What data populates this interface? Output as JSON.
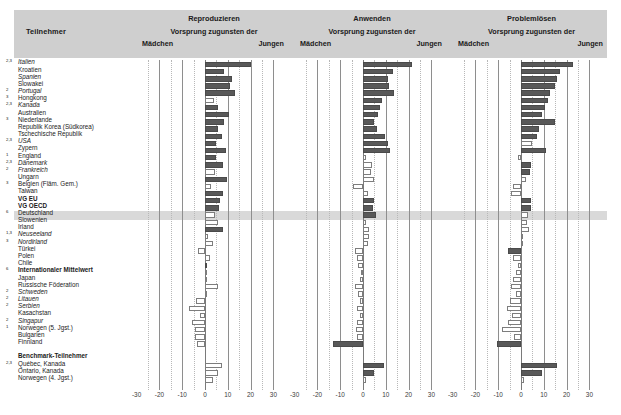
{
  "header": {
    "participants_label": "Teilnehmer",
    "panels": [
      {
        "title": "Reproduzieren",
        "subtitle": "Vorsprung zugunsten der",
        "girls": "Mädchen",
        "boys": "Jungen"
      },
      {
        "title": "Anwenden",
        "subtitle": "Vorsprung zugunsten der",
        "girls": "Mädchen",
        "boys": "Jungen"
      },
      {
        "title": "Problemlösen",
        "subtitle": "Vorsprung zugunsten der",
        "girls": "Mädchen",
        "boys": "Jungen"
      }
    ]
  },
  "axis": {
    "ticks": [
      "-30",
      "-20",
      "-10",
      "0",
      "10",
      "20",
      "30"
    ],
    "tick_values": [
      -30,
      -20,
      -10,
      0,
      10,
      20,
      30
    ],
    "min": -34,
    "max": 34
  },
  "chart_data": {
    "type": "bar",
    "xlabel": "Vorsprung zugunsten der Mädchen / Jungen",
    "ylabel": "Teilnehmer",
    "xlim": [
      -34,
      34
    ],
    "grid": true,
    "legend_position": "none",
    "orientation": "horizontal",
    "series_names": [
      "Reproduzieren",
      "Anwenden",
      "Problemlösen"
    ],
    "fill_meaning": {
      "filled": "statistisch signifikant",
      "open": "nicht signifikant"
    },
    "categories": [
      "Italien",
      "Kroatien",
      "Spanien",
      "Slowakei",
      "Portugal",
      "Hongkong",
      "Kanada",
      "Australien",
      "Niederlande",
      "Republik Korea (Südkorea)",
      "Tschechische Republik",
      "USA",
      "Zypern",
      "England",
      "Dänemark",
      "Frankreich",
      "Ungarn",
      "Belgien (Fläm. Gem.)",
      "Taiwan",
      "VG EU",
      "VG OECD",
      "Deutschland",
      "Slowenien",
      "Irland",
      "Neuseeland",
      "Nordirland",
      "Türkei",
      "Polen",
      "Chile",
      "Internationaler Mittelwert",
      "Japan",
      "Russische Föderation",
      "Schweden",
      "Litauen",
      "Serbien",
      "Kasachstan",
      "Singapur",
      "Norwegen (5. Jgst.)",
      "Bulgarien",
      "Finnland",
      "Québec, Kanada",
      "Ontario, Kanada",
      "Norwegen (4. Jgst.)"
    ],
    "rows": [
      {
        "label": "Italien",
        "sup": "2,3",
        "style": "italic",
        "reproduzieren": 20.0,
        "rep_sig": true,
        "anwenden": 21.5,
        "anw_sig": true,
        "problemloesen": 23.0,
        "prob_sig": true
      },
      {
        "label": "Kroatien",
        "sup": "",
        "style": "normal",
        "reproduzieren": 8.5,
        "rep_sig": true,
        "anwenden": 13.0,
        "anw_sig": true,
        "problemloesen": 17.0,
        "prob_sig": true
      },
      {
        "label": "Spanien",
        "sup": "",
        "style": "italic",
        "reproduzieren": 12.0,
        "rep_sig": true,
        "anwenden": 11.0,
        "anw_sig": true,
        "problemloesen": 16.0,
        "prob_sig": true
      },
      {
        "label": "Slowakei",
        "sup": "",
        "style": "normal",
        "reproduzieren": 11.0,
        "rep_sig": true,
        "anwenden": 11.5,
        "anw_sig": true,
        "problemloesen": 15.0,
        "prob_sig": true
      },
      {
        "label": "Portugal",
        "sup": "2",
        "style": "italic",
        "reproduzieren": 13.0,
        "rep_sig": true,
        "anwenden": 13.5,
        "anw_sig": true,
        "problemloesen": 12.5,
        "prob_sig": true
      },
      {
        "label": "Hongkong",
        "sup": "3",
        "style": "normal",
        "reproduzieren": 4.0,
        "rep_sig": false,
        "anwenden": 8.5,
        "anw_sig": true,
        "problemloesen": 12.0,
        "prob_sig": true
      },
      {
        "label": "Kanada",
        "sup": "2,3",
        "style": "italic",
        "reproduzieren": 5.5,
        "rep_sig": true,
        "anwenden": 7.5,
        "anw_sig": true,
        "problemloesen": 10.5,
        "prob_sig": true
      },
      {
        "label": "Australien",
        "sup": "",
        "style": "normal",
        "reproduzieren": 10.5,
        "rep_sig": true,
        "anwenden": 6.5,
        "anw_sig": true,
        "problemloesen": 9.0,
        "prob_sig": true
      },
      {
        "label": "Niederlande",
        "sup": "3",
        "style": "normal",
        "reproduzieren": 8.5,
        "rep_sig": true,
        "anwenden": 5.0,
        "anw_sig": true,
        "problemloesen": 15.0,
        "prob_sig": true
      },
      {
        "label": "Republik Korea (Südkorea)",
        "sup": "",
        "style": "normal",
        "reproduzieren": 5.5,
        "rep_sig": true,
        "anwenden": 6.0,
        "anw_sig": true,
        "problemloesen": 8.0,
        "prob_sig": true
      },
      {
        "label": "Tschechische Republik",
        "sup": "",
        "style": "normal",
        "reproduzieren": 7.5,
        "rep_sig": true,
        "anwenden": 9.5,
        "anw_sig": true,
        "problemloesen": 7.0,
        "prob_sig": true
      },
      {
        "label": "USA",
        "sup": "2,3",
        "style": "italic",
        "reproduzieren": 5.0,
        "rep_sig": true,
        "anwenden": 11.0,
        "anw_sig": true,
        "problemloesen": 5.0,
        "prob_sig": false
      },
      {
        "label": "Zypern",
        "sup": "",
        "style": "normal",
        "reproduzieren": 9.0,
        "rep_sig": true,
        "anwenden": 12.0,
        "anw_sig": true,
        "problemloesen": 11.0,
        "prob_sig": true
      },
      {
        "label": "England",
        "sup": "1",
        "style": "normal",
        "reproduzieren": 5.0,
        "rep_sig": true,
        "anwenden": 1.5,
        "anw_sig": false,
        "problemloesen": -1.5,
        "prob_sig": false
      },
      {
        "label": "Dänemark",
        "sup": "2,3",
        "style": "italic",
        "reproduzieren": 8.0,
        "rep_sig": true,
        "anwenden": 4.0,
        "anw_sig": false,
        "problemloesen": 4.5,
        "prob_sig": true
      },
      {
        "label": "Frankreich",
        "sup": "2",
        "style": "italic",
        "reproduzieren": 4.5,
        "rep_sig": false,
        "anwenden": 3.5,
        "anw_sig": false,
        "problemloesen": 4.0,
        "prob_sig": true
      },
      {
        "label": "Ungarn",
        "sup": "",
        "style": "normal",
        "reproduzieren": 9.5,
        "rep_sig": true,
        "anwenden": 5.0,
        "anw_sig": false,
        "problemloesen": 2.0,
        "prob_sig": false
      },
      {
        "label": "Belgien (Fläm. Gem.)",
        "sup": "3",
        "style": "normal",
        "reproduzieren": 2.5,
        "rep_sig": false,
        "anwenden": -4.5,
        "anw_sig": false,
        "problemloesen": -3.5,
        "prob_sig": false
      },
      {
        "label": "Taiwan",
        "sup": "",
        "style": "normal",
        "reproduzieren": 8.0,
        "rep_sig": true,
        "anwenden": 2.0,
        "anw_sig": false,
        "problemloesen": -4.5,
        "prob_sig": false
      },
      {
        "label": "VG EU",
        "sup": "",
        "style": "bold",
        "reproduzieren": 6.5,
        "rep_sig": true,
        "anwenden": 5.0,
        "anw_sig": true,
        "problemloesen": 4.5,
        "prob_sig": true
      },
      {
        "label": "VG OECD",
        "sup": "",
        "style": "bold",
        "reproduzieren": 6.0,
        "rep_sig": true,
        "anwenden": 4.5,
        "anw_sig": true,
        "problemloesen": 4.5,
        "prob_sig": true
      },
      {
        "label": "Deutschland",
        "sup": "6",
        "style": "normal",
        "highlight": true,
        "reproduzieren": 4.5,
        "rep_sig": false,
        "anwenden": 5.5,
        "anw_sig": true,
        "problemloesen": 3.0,
        "prob_sig": false
      },
      {
        "label": "Slowenien",
        "sup": "",
        "style": "normal",
        "reproduzieren": 5.5,
        "rep_sig": false,
        "anwenden": 1.5,
        "anw_sig": false,
        "problemloesen": 2.5,
        "prob_sig": false
      },
      {
        "label": "Irland",
        "sup": "",
        "style": "normal",
        "reproduzieren": 8.0,
        "rep_sig": true,
        "anwenden": 2.5,
        "anw_sig": false,
        "problemloesen": 3.5,
        "prob_sig": false
      },
      {
        "label": "Neuseeland",
        "sup": "1,3",
        "style": "italic",
        "reproduzieren": 1.5,
        "rep_sig": false,
        "anwenden": 2.5,
        "anw_sig": false,
        "problemloesen": 1.0,
        "prob_sig": false
      },
      {
        "label": "Nordirland",
        "sup": "3",
        "style": "italic",
        "reproduzieren": 3.5,
        "rep_sig": false,
        "anwenden": 2.0,
        "anw_sig": false,
        "problemloesen": 0.5,
        "prob_sig": false
      },
      {
        "label": "Türkei",
        "sup": "",
        "style": "normal",
        "reproduzieren": -3.0,
        "rep_sig": false,
        "anwenden": -3.5,
        "anw_sig": false,
        "problemloesen": -5.5,
        "prob_sig": true
      },
      {
        "label": "Polen",
        "sup": "",
        "style": "normal",
        "reproduzieren": 2.0,
        "rep_sig": false,
        "anwenden": -2.5,
        "anw_sig": false,
        "problemloesen": -3.5,
        "prob_sig": false
      },
      {
        "label": "Chile",
        "sup": "",
        "style": "normal",
        "reproduzieren": 1.0,
        "rep_sig": true,
        "anwenden": -2.0,
        "anw_sig": false,
        "problemloesen": -1.5,
        "prob_sig": false
      },
      {
        "label": "Internationaler Mittelwert",
        "sup": "6",
        "style": "bold",
        "reproduzieren": 0.5,
        "rep_sig": false,
        "anwenden": -1.0,
        "anw_sig": false,
        "problemloesen": -2.0,
        "prob_sig": false
      },
      {
        "label": "Japan",
        "sup": "",
        "style": "normal",
        "reproduzieren": 1.0,
        "rep_sig": false,
        "anwenden": -1.5,
        "anw_sig": false,
        "problemloesen": -3.5,
        "prob_sig": false
      },
      {
        "label": "Russische Föderation",
        "sup": "",
        "style": "normal",
        "reproduzieren": 5.5,
        "rep_sig": false,
        "anwenden": -3.5,
        "anw_sig": false,
        "problemloesen": -4.5,
        "prob_sig": false
      },
      {
        "label": "Schweden",
        "sup": "2",
        "style": "italic",
        "reproduzieren": 0.5,
        "rep_sig": false,
        "anwenden": -2.0,
        "anw_sig": false,
        "problemloesen": -2.0,
        "prob_sig": false
      },
      {
        "label": "Litauen",
        "sup": "2",
        "style": "italic",
        "reproduzieren": -4.0,
        "rep_sig": false,
        "anwenden": -1.5,
        "anw_sig": false,
        "problemloesen": -5.0,
        "prob_sig": false
      },
      {
        "label": "Serbien",
        "sup": "2",
        "style": "italic",
        "reproduzieren": -7.0,
        "rep_sig": false,
        "anwenden": -2.5,
        "anw_sig": false,
        "problemloesen": -6.0,
        "prob_sig": false
      },
      {
        "label": "Kasachstan",
        "sup": "",
        "style": "normal",
        "reproduzieren": -2.0,
        "rep_sig": false,
        "anwenden": -1.5,
        "anw_sig": false,
        "problemloesen": -4.0,
        "prob_sig": false
      },
      {
        "label": "Singapur",
        "sup": "2",
        "style": "italic",
        "reproduzieren": -5.5,
        "rep_sig": false,
        "anwenden": -2.5,
        "anw_sig": false,
        "problemloesen": -5.5,
        "prob_sig": false
      },
      {
        "label": "Norwegen (5. Jgst.)",
        "sup": "1",
        "style": "normal",
        "reproduzieren": -4.5,
        "rep_sig": false,
        "anwenden": -3.0,
        "anw_sig": false,
        "problemloesen": -8.5,
        "prob_sig": false
      },
      {
        "label": "Bulgarien",
        "sup": "",
        "style": "normal",
        "reproduzieren": -4.5,
        "rep_sig": false,
        "anwenden": -2.5,
        "anw_sig": false,
        "problemloesen": -3.0,
        "prob_sig": false
      },
      {
        "label": "Finnland",
        "sup": "",
        "style": "normal",
        "reproduzieren": -3.5,
        "rep_sig": false,
        "anwenden": -13.0,
        "anw_sig": true,
        "problemloesen": -10.5,
        "prob_sig": true
      },
      {
        "label": "",
        "sup": "",
        "style": "normal",
        "spacer": true
      },
      {
        "label": "Benchmark-Teilnehmer",
        "sup": "",
        "style": "bold",
        "header": true
      },
      {
        "label": "Québec, Kanada",
        "sup": "2,3",
        "style": "normal",
        "reproduzieren": 7.5,
        "rep_sig": false,
        "anwenden": 9.0,
        "anw_sig": true,
        "problemloesen": 16.0,
        "prob_sig": true
      },
      {
        "label": "Ontario, Kanada",
        "sup": "",
        "style": "normal",
        "reproduzieren": 5.5,
        "rep_sig": false,
        "anwenden": 5.0,
        "anw_sig": true,
        "problemloesen": 9.0,
        "prob_sig": true
      },
      {
        "label": "Norwegen (4. Jgst.)",
        "sup": "",
        "style": "normal",
        "reproduzieren": 3.5,
        "rep_sig": false,
        "anwenden": 1.5,
        "anw_sig": false,
        "problemloesen": 1.5,
        "prob_sig": false
      }
    ]
  }
}
